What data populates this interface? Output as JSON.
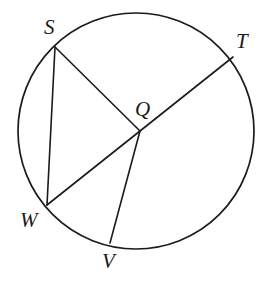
{
  "figure": {
    "background_color": "#ffffff",
    "stroke_color": "#1a1a1a",
    "label_color": "#1a1a1a",
    "stroke_width": 1.6,
    "width": 278,
    "height": 282
  },
  "circle": {
    "name": "circle-Q",
    "center_x": 136,
    "center_y": 131,
    "radius": 118,
    "fill": "none"
  },
  "points": [
    {
      "id": "S",
      "label": "S",
      "x": 55,
      "y": 47,
      "on_circle": true,
      "label_x": 44,
      "label_y": 17
    },
    {
      "id": "T",
      "label": "T",
      "x": 233,
      "y": 57,
      "on_circle": true,
      "label_x": 236,
      "label_y": 31
    },
    {
      "id": "Q",
      "label": "Q",
      "x": 140,
      "y": 131,
      "on_circle": false,
      "label_x": 135,
      "label_y": 99
    },
    {
      "id": "W",
      "label": "W",
      "x": 47,
      "y": 205,
      "on_circle": true,
      "label_x": 20,
      "label_y": 210
    },
    {
      "id": "V",
      "label": "V",
      "x": 110,
      "y": 243,
      "on_circle": true,
      "label_x": 102,
      "label_y": 251
    }
  ],
  "segments": [
    {
      "id": "SW",
      "name": "chord-SW",
      "from": "S",
      "to": "W",
      "x1": 55,
      "y1": 47,
      "x2": 47,
      "y2": 205
    },
    {
      "id": "SQ",
      "name": "radius-QS",
      "from": "S",
      "to": "Q",
      "x1": 55,
      "y1": 47,
      "x2": 140,
      "y2": 131
    },
    {
      "id": "WT",
      "name": "diameter-WT",
      "from": "W",
      "to": "T",
      "x1": 47,
      "y1": 205,
      "x2": 233,
      "y2": 57
    },
    {
      "id": "QV",
      "name": "radius-QV",
      "from": "Q",
      "to": "V",
      "x1": 140,
      "y1": 131,
      "x2": 110,
      "y2": 243
    }
  ]
}
